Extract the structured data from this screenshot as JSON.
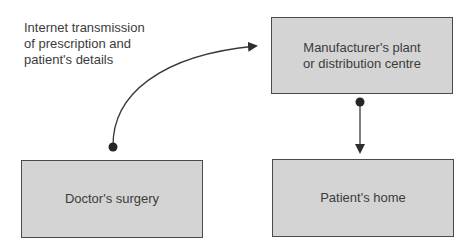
{
  "diagram": {
    "annotation": {
      "lines": [
        "Internet transmission",
        "of prescription and",
        "patient's details"
      ]
    },
    "nodes": {
      "manufacturer": {
        "lines": [
          "Manufacturer's plant",
          "or distribution centre"
        ]
      },
      "doctor": {
        "lines": [
          "Doctor's surgery"
        ]
      },
      "patient": {
        "lines": [
          "Patient's home"
        ]
      }
    },
    "edges": [
      {
        "from": "Doctor's surgery",
        "to": "Manufacturer's plant or distribution centre",
        "label": "Internet transmission of prescription and patient's details",
        "style": "curved arrow"
      },
      {
        "from": "Manufacturer's plant or distribution centre",
        "to": "Patient's home",
        "style": "straight arrow"
      }
    ],
    "colors": {
      "box_fill": "#d4d4d4",
      "stroke": "#3a3a3a",
      "text": "#3c3c3c"
    }
  }
}
